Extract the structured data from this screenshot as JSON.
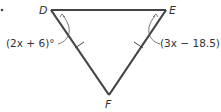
{
  "diagram": {
    "type": "isosceles-triangle",
    "vertices": {
      "D": {
        "label": "D"
      },
      "E": {
        "label": "E"
      },
      "F": {
        "label": "F"
      }
    },
    "angle_labels": {
      "D": "(2x + 6)°",
      "E": "(3x − 18.5)"
    },
    "congruent_sides": [
      "DF",
      "EF"
    ],
    "colors": {
      "stroke": "#444444",
      "text": "#333333",
      "background": "#ffffff"
    }
  }
}
